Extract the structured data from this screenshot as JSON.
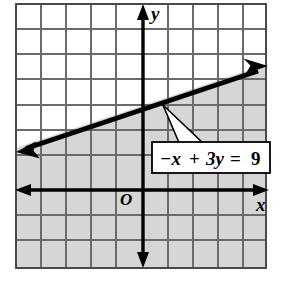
{
  "figure": {
    "name": "coordinate-plane-inequality-graph",
    "background_color": "#ffffff",
    "grid": {
      "line_color": "#6b6b6b",
      "border_color": "#4a4a4a",
      "cell_size_px": 25,
      "columns": 10,
      "rows": 10.5,
      "left_px": 16,
      "top_px": 4,
      "right_px": 266,
      "bottom_px": 268
    },
    "axes": {
      "x_axis_label": "x",
      "y_axis_label": "y",
      "origin_label": "O",
      "origin_x_px": 143,
      "origin_y_px": 190,
      "axis_color": "#000000",
      "x_min": -5,
      "x_max": 5,
      "y_min": -3,
      "y_max": 7.5
    },
    "shading": {
      "region_color": "#d6d6d6",
      "description": "region-below-line"
    },
    "boundary_line": {
      "color": "#000000",
      "style": "solid",
      "slope": 0.3333,
      "y_intercept": 3,
      "arrow_both_ends": true,
      "left_tip_px": [
        18,
        151
      ],
      "right_tip_px": [
        266,
        67
      ]
    },
    "callout": {
      "equation_parts": {
        "minus_x": "−x",
        "plus": "+",
        "three_y": "3y",
        "equals": "=",
        "nine": "9"
      },
      "equation_full": "−x + 3y = 9",
      "box_fill": "#ffffff",
      "box_stroke": "#000000",
      "pointer_target_px": [
        163,
        105
      ]
    }
  }
}
